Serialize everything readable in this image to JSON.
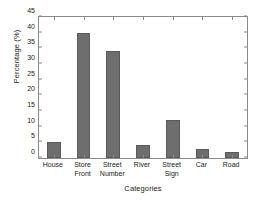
{
  "chart_data": {
    "type": "bar",
    "title": "",
    "xlabel": "Categories",
    "ylabel": "Percentage (%)",
    "categories": [
      "House",
      "Store Front",
      "Street Number",
      "River",
      "Street Sign",
      "Car",
      "Road"
    ],
    "category_lines": [
      [
        "House"
      ],
      [
        "Store",
        "Front"
      ],
      [
        "Street",
        "Number"
      ],
      [
        "River"
      ],
      [
        "Street",
        "Sign"
      ],
      [
        "Car"
      ],
      [
        "Road"
      ]
    ],
    "values": [
      5,
      40,
      34,
      4,
      12,
      3,
      2
    ],
    "ylim": [
      0,
      45
    ],
    "ytick_values": [
      0,
      5,
      10,
      15,
      20,
      25,
      30,
      35,
      40,
      45
    ],
    "ytick_labels": [
      "0",
      "5",
      "10",
      "15",
      "20",
      "25",
      "30",
      "35",
      "40",
      "45"
    ],
    "grid": false,
    "legend": null,
    "bar_color": "#6e6e6e",
    "bar_edge_color": "#5a5a5a",
    "axis_color": "#8a8a8a",
    "background_color": "#ffffff"
  }
}
